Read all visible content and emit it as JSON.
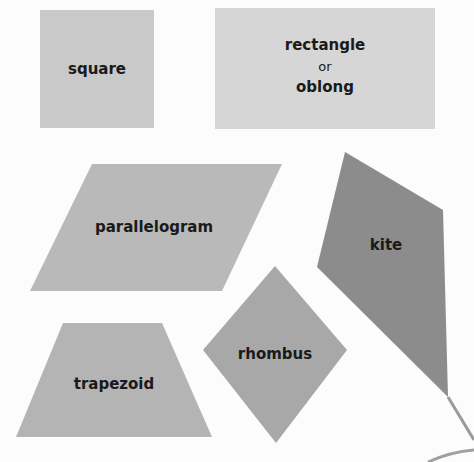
{
  "diagram": {
    "title": "",
    "shapes": [
      {
        "id": "square",
        "label": "square",
        "color": "#c9c9c9"
      },
      {
        "id": "rectangle",
        "label_line1": "rectangle",
        "label_line2": "or",
        "label_line3": "oblong",
        "color": "#d6d6d6"
      },
      {
        "id": "parallelogram",
        "label": "parallelogram",
        "color": "#b9b9b9"
      },
      {
        "id": "kite",
        "label": "kite",
        "color": "#8c8c8c"
      },
      {
        "id": "rhombus",
        "label": "rhombus",
        "color": "#a8a8a8"
      },
      {
        "id": "trapezoid",
        "label": "trapezoid",
        "color": "#b4b4b4"
      }
    ]
  }
}
